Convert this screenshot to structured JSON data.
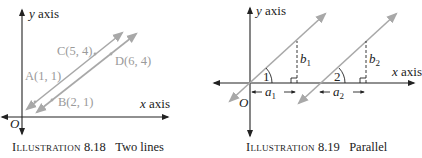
{
  "illustrations": [
    {
      "id": "8.18",
      "caption_prefix": "Illustration",
      "caption_number": "8.18",
      "caption_text": "Two lines",
      "axes": {
        "x_label": "x axis",
        "y_label": "y axis",
        "origin_label": "O"
      },
      "points": [
        {
          "name": "A",
          "label": "A(1, 1)"
        },
        {
          "name": "B",
          "label": "B(2, 1)"
        },
        {
          "name": "C",
          "label": "C(5, 4)"
        },
        {
          "name": "D",
          "label": "D(6, 4)"
        }
      ],
      "colors": {
        "axis": "#222222",
        "line": "#a8a8a8",
        "point_label": "#9a9a9a"
      }
    },
    {
      "id": "8.19",
      "caption_prefix": "Illustration",
      "caption_number": "8.19",
      "caption_text": "Parallel",
      "axes": {
        "x_label": "x axis",
        "y_label": "y axis",
        "origin_label": "O"
      },
      "angles": [
        "1",
        "2"
      ],
      "runs": [
        "a",
        "a"
      ],
      "run_subscripts": [
        "1",
        "2"
      ],
      "rises": [
        "b",
        "b"
      ],
      "rise_subscripts": [
        "1",
        "2"
      ],
      "colors": {
        "axis": "#222222",
        "line": "#a8a8a8"
      }
    }
  ]
}
